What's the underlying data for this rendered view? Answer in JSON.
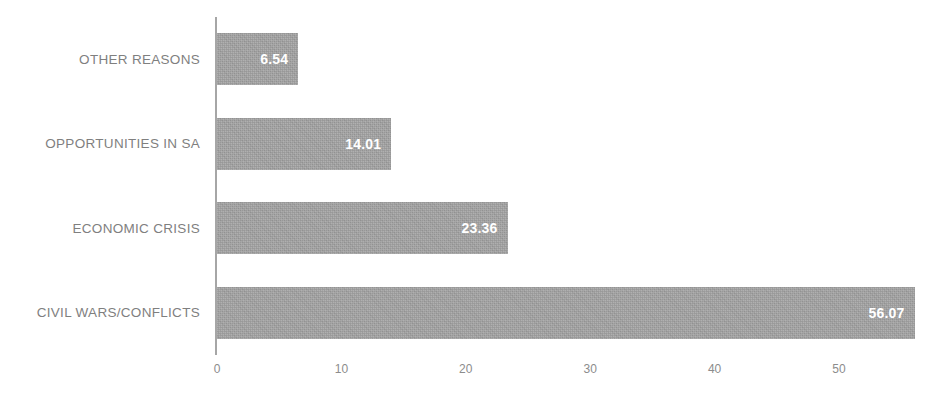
{
  "chart_data": {
    "type": "bar",
    "orientation": "horizontal",
    "title": "",
    "subtitle": "",
    "xlabel": "",
    "ylabel": "",
    "categories": [
      "OTHER REASONS",
      "OPPORTUNITIES IN SA",
      "ECONOMIC CRISIS",
      "CIVIL WARS/CONFLICTS"
    ],
    "values": [
      6.54,
      14.01,
      23.36,
      56.07
    ],
    "value_labels": [
      "6.54",
      "14.01",
      "23.36",
      "56.07"
    ],
    "xlim": [
      0,
      56.07
    ],
    "xticks": [
      0,
      10,
      20,
      30,
      40,
      50
    ],
    "xtick_labels": [
      "0",
      "10",
      "20",
      "30",
      "40",
      "50"
    ],
    "grid": false,
    "legend": false,
    "legend_position": "none",
    "bar_color": "#a3a3a3",
    "value_label_color": "#ffffff",
    "category_label_color": "#7f7f7f",
    "axis_color": "#a6a6a6",
    "tick_label_color": "#8c8c8c",
    "background_color": "#ffffff"
  }
}
